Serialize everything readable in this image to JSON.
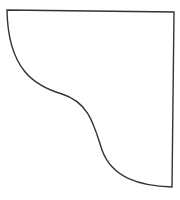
{
  "shape": {
    "name": "curved-quarter-shape",
    "stroke_color": "#333333",
    "fill_color": "#ffffff",
    "stroke_width": 1.4,
    "path": "M 7 10 L 174 12 L 172 187 C 140 186, 112 178, 102 150 C 94 126, 90 103, 62 94 C 35 86, 8 70, 7 10 Z"
  }
}
